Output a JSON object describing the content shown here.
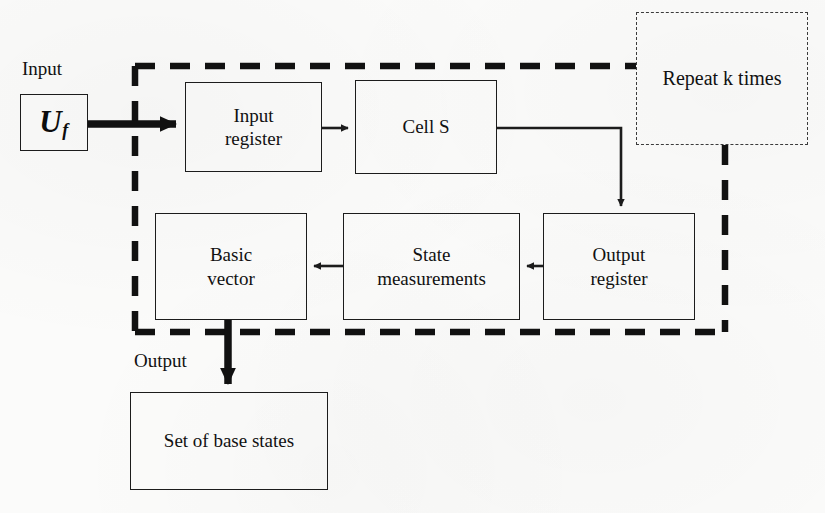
{
  "diagram": {
    "colors": {
      "ink": "#1c1c1c",
      "paper": "#fbfbfa",
      "thin_dash": "#3b3b3b"
    },
    "labels": {
      "input": "Input",
      "output": "Output"
    },
    "source_block": {
      "name": "Uf",
      "symbol": "U",
      "subscript": "f"
    },
    "nodes": [
      {
        "id": "input-register",
        "label_line1": "Input",
        "label_line2": "register"
      },
      {
        "id": "cell-s",
        "label_line1": "Cell S",
        "label_line2": ""
      },
      {
        "id": "output-register",
        "label_line1": "Output",
        "label_line2": "register"
      },
      {
        "id": "state-measurements",
        "label_line1": "State",
        "label_line2": "measurements"
      },
      {
        "id": "basic-vector",
        "label_line1": "Basic",
        "label_line2": "vector"
      },
      {
        "id": "set-of-base-states",
        "label_line1": "Set of base states",
        "label_line2": ""
      }
    ],
    "repeat_annotation": "Repeat k times",
    "edges": [
      {
        "from": "Uf",
        "to": "input-register",
        "style": "thick"
      },
      {
        "from": "input-register",
        "to": "cell-s",
        "style": "thin"
      },
      {
        "from": "cell-s",
        "to": "output-register",
        "style": "thin"
      },
      {
        "from": "output-register",
        "to": "state-measurements",
        "style": "thin"
      },
      {
        "from": "state-measurements",
        "to": "basic-vector",
        "style": "thin"
      },
      {
        "from": "basic-vector",
        "to": "set-of-base-states",
        "style": "thick"
      }
    ],
    "loop_boundary": {
      "style": "thick-dashed",
      "meaning": "Repeat k times"
    }
  }
}
